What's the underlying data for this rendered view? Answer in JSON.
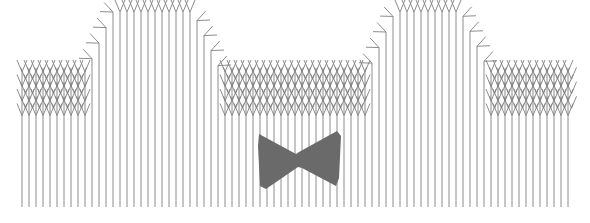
{
  "document": {
    "title": "Hatched Region Diagram",
    "width": 590,
    "height": 223,
    "background_color": "#ffffff"
  },
  "style": {
    "hatch_color": "#808080",
    "hatch_stroke_width": 0.9,
    "arrow_color": "#808080",
    "arrow_stroke_width": 0.9,
    "fill_shape_color": "#6a6a6a",
    "fill_shape_opacity": 1
  },
  "chart_data": {
    "type": "diagram",
    "title": "",
    "xlabel": "",
    "ylabel": "",
    "xlim": [
      0,
      590
    ],
    "ylim": [
      0,
      223
    ],
    "grid": false,
    "legend": false,
    "region": {
      "name": "hatched-region",
      "left_x": 22,
      "right_x": 572,
      "base_top_y": 72,
      "bottom_y": 207,
      "humps": [
        {
          "name": "left-hump",
          "foot_left_x": 86,
          "top_left_x": 113,
          "top_right_x": 193,
          "foot_right_x": 221,
          "apex_y": 12
        },
        {
          "name": "right-hump",
          "foot_left_x": 368,
          "top_left_x": 395,
          "top_right_x": 461,
          "foot_right_x": 489,
          "apex_y": 12
        }
      ]
    },
    "hatch": {
      "spacing": 7.0,
      "arrow_rows": 4,
      "arrow_row_spacing": 14.5,
      "arrow_half_width": 5.0,
      "arrow_length": 12.0,
      "line_count_estimate": 79
    },
    "marker": {
      "name": "bowtie-marker",
      "shape": "bowtie",
      "left_x": 258,
      "right_x": 341,
      "top_y": 131,
      "bottom_y": 189,
      "waist_x": 299,
      "waist_top_y": 153,
      "waist_bottom_y": 166,
      "color": "#6a6a6a",
      "polygon": [
        [
          259,
          134
        ],
        [
          296,
          154
        ],
        [
          299,
          152
        ],
        [
          337,
          131
        ],
        [
          341,
          136
        ],
        [
          339,
          178
        ],
        [
          336,
          186
        ],
        [
          302,
          168
        ],
        [
          298,
          167
        ],
        [
          266,
          189
        ],
        [
          260,
          186
        ],
        [
          258,
          146
        ]
      ]
    }
  },
  "elements": {
    "region_label": "hatched-region",
    "marker_label": "bowtie-marker",
    "left_hump_label": "left-hump",
    "right_hump_label": "right-hump"
  }
}
